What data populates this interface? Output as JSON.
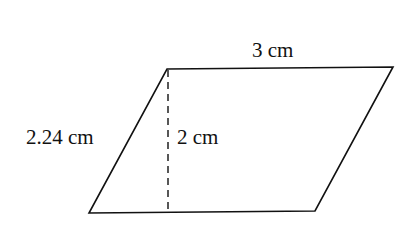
{
  "diagram": {
    "shape": "parallelogram",
    "labels": {
      "top_side": "3 cm",
      "slant_side": "2.24 cm",
      "height": "2 cm"
    },
    "colors": {
      "stroke": "#111111",
      "background": "#ffffff"
    }
  }
}
